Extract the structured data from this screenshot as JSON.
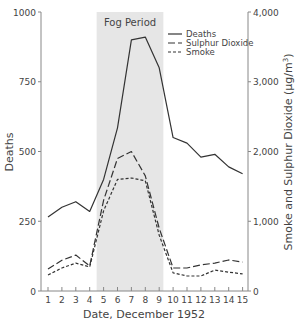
{
  "chart_data": {
    "type": "line",
    "title": "",
    "annotation": "Fog Period",
    "fog_period_days": [
      4.5,
      9.3
    ],
    "xlabel": "Date, December 1952",
    "ylabel_left": "Deaths",
    "ylabel_right": "Smoke and Sulphur Dioxide (µg/m³)",
    "x": [
      1,
      2,
      3,
      4,
      5,
      6,
      7,
      8,
      9,
      10,
      11,
      12,
      13,
      14,
      15
    ],
    "ylim_left": [
      0,
      1000
    ],
    "ylim_right": [
      0,
      4000
    ],
    "yticks_left": [
      "0",
      "250",
      "500",
      "750",
      "1000"
    ],
    "yticks_right": [
      "0",
      "1,000",
      "2,000",
      "3,000",
      "4,000"
    ],
    "legend": [
      "Deaths",
      "Sulphur Dioxide",
      "Smoke"
    ],
    "legend_position": "upper right",
    "grid": false,
    "series": [
      {
        "name": "Deaths",
        "axis": "left",
        "style": "solid",
        "values": [
          265,
          300,
          320,
          285,
          400,
          585,
          900,
          910,
          800,
          550,
          530,
          480,
          490,
          445,
          420
        ]
      },
      {
        "name": "Sulphur Dioxide",
        "axis": "right",
        "style": "dashed",
        "values": [
          315,
          440,
          515,
          360,
          1300,
          1900,
          2000,
          1650,
          900,
          330,
          330,
          375,
          400,
          445,
          415
        ]
      },
      {
        "name": "Smoke",
        "axis": "right",
        "style": "dotted",
        "values": [
          230,
          330,
          400,
          345,
          1150,
          1600,
          1620,
          1580,
          800,
          260,
          215,
          215,
          300,
          270,
          245
        ]
      }
    ]
  }
}
